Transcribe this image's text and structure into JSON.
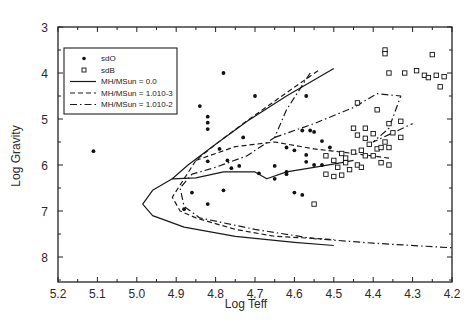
{
  "chart_data": {
    "type": "scatter",
    "title": "",
    "xlabel": "Log Teff",
    "ylabel": "Log Gravity",
    "xlim": [
      5.2,
      4.2
    ],
    "ylim": [
      8.5,
      3
    ],
    "x_ticks": [
      "5.2",
      "5.1",
      "5.0",
      "4.9",
      "4.8",
      "4.7",
      "4.6",
      "4.5",
      "4.4",
      "4.3",
      "4.2"
    ],
    "y_ticks": [
      "3",
      "4",
      "5",
      "6",
      "7",
      "8"
    ],
    "grid": false,
    "legend_position": "upper-left",
    "legend": [
      {
        "label": "sdO",
        "marker": "filled-circle"
      },
      {
        "label": "sdB",
        "marker": "open-square"
      },
      {
        "label": "MH/MSun = 0.0",
        "style": "solid"
      },
      {
        "label": "MH/MSun = 1.010-3",
        "style": "dashed"
      },
      {
        "label": "MH/MSun = 1.010-2",
        "style": "dash-dot"
      }
    ],
    "series": [
      {
        "name": "sdO",
        "type": "scatter",
        "points": [
          [
            5.11,
            5.7
          ],
          [
            4.78,
            4.0
          ],
          [
            4.84,
            4.72
          ],
          [
            4.82,
            4.95
          ],
          [
            4.82,
            5.08
          ],
          [
            4.82,
            5.22
          ],
          [
            4.79,
            5.65
          ],
          [
            4.82,
            5.92
          ],
          [
            4.77,
            5.9
          ],
          [
            4.73,
            5.4
          ],
          [
            4.7,
            4.5
          ],
          [
            4.62,
            5.62
          ],
          [
            4.57,
            4.5
          ],
          [
            4.58,
            5.25
          ],
          [
            4.56,
            5.25
          ],
          [
            4.55,
            5.28
          ],
          [
            4.57,
            5.93
          ],
          [
            4.55,
            6.0
          ],
          [
            4.53,
            6.0
          ],
          [
            4.65,
            6.02
          ],
          [
            4.6,
            5.68
          ],
          [
            4.62,
            6.15
          ],
          [
            4.6,
            6.6
          ],
          [
            4.58,
            6.65
          ],
          [
            4.62,
            6.2
          ],
          [
            4.57,
            5.78
          ],
          [
            4.86,
            6.6
          ],
          [
            4.78,
            6.55
          ],
          [
            4.82,
            6.85
          ],
          [
            4.88,
            6.96
          ],
          [
            4.74,
            6.02
          ],
          [
            4.76,
            6.07
          ],
          [
            4.65,
            6.3
          ],
          [
            4.69,
            6.18
          ],
          [
            4.53,
            5.48
          ],
          [
            4.51,
            5.62
          ]
        ]
      },
      {
        "name": "sdB",
        "type": "scatter",
        "points": [
          [
            4.37,
            3.5
          ],
          [
            4.37,
            3.58
          ],
          [
            4.25,
            3.6
          ],
          [
            4.29,
            3.95
          ],
          [
            4.27,
            4.05
          ],
          [
            4.24,
            4.05
          ],
          [
            4.22,
            4.08
          ],
          [
            4.26,
            4.1
          ],
          [
            4.23,
            4.3
          ],
          [
            4.36,
            4.0
          ],
          [
            4.32,
            4.0
          ],
          [
            4.44,
            4.65
          ],
          [
            4.48,
            5.75
          ],
          [
            4.52,
            5.8
          ],
          [
            4.5,
            5.9
          ],
          [
            4.47,
            5.85
          ],
          [
            4.45,
            5.72
          ],
          [
            4.43,
            5.68
          ],
          [
            4.41,
            5.55
          ],
          [
            4.39,
            5.65
          ],
          [
            4.37,
            5.5
          ],
          [
            4.36,
            5.62
          ],
          [
            4.47,
            5.95
          ],
          [
            4.49,
            6.05
          ],
          [
            4.46,
            6.1
          ],
          [
            4.52,
            6.2
          ],
          [
            4.5,
            6.25
          ],
          [
            4.48,
            6.22
          ],
          [
            4.44,
            6.0
          ],
          [
            4.42,
            5.8
          ],
          [
            4.4,
            5.8
          ],
          [
            4.38,
            5.62
          ],
          [
            4.4,
            5.32
          ],
          [
            4.42,
            5.42
          ],
          [
            4.44,
            5.35
          ],
          [
            4.39,
            4.8
          ],
          [
            4.35,
            5.3
          ],
          [
            4.33,
            5.4
          ],
          [
            4.36,
            5.1
          ],
          [
            4.33,
            5.05
          ],
          [
            4.45,
            5.2
          ],
          [
            4.42,
            5.2
          ],
          [
            4.36,
            6.0
          ],
          [
            4.38,
            5.95
          ],
          [
            4.43,
            6.05
          ],
          [
            4.55,
            6.85
          ]
        ]
      },
      {
        "name": "MH/MSun = 0.0",
        "type": "line",
        "style": "solid",
        "points": [
          [
            4.5,
            3.9
          ],
          [
            4.62,
            4.5
          ],
          [
            4.72,
            5.05
          ],
          [
            4.8,
            5.55
          ],
          [
            4.87,
            6.0
          ],
          [
            4.91,
            6.3
          ],
          [
            4.85,
            6.28
          ],
          [
            4.78,
            6.15
          ],
          [
            4.7,
            6.15
          ],
          [
            4.67,
            6.3
          ],
          [
            4.62,
            6.15
          ],
          [
            4.55,
            6.05
          ],
          [
            4.48,
            5.95
          ],
          [
            4.45,
            5.9
          ]
        ],
        "loop": [
          [
            4.91,
            6.3
          ],
          [
            4.96,
            6.55
          ],
          [
            4.985,
            6.85
          ],
          [
            4.96,
            7.1
          ],
          [
            4.88,
            7.35
          ],
          [
            4.75,
            7.55
          ],
          [
            4.6,
            7.68
          ],
          [
            4.5,
            7.75
          ]
        ]
      },
      {
        "name": "MH/MSun = 1.010-3",
        "type": "line",
        "style": "dashed",
        "points": [
          [
            4.54,
            3.95
          ],
          [
            4.64,
            4.55
          ],
          [
            4.73,
            5.1
          ],
          [
            4.8,
            5.55
          ],
          [
            4.85,
            5.9
          ],
          [
            4.88,
            6.3
          ],
          [
            4.91,
            6.7
          ],
          [
            4.89,
            7.0
          ],
          [
            4.85,
            7.15
          ],
          [
            4.75,
            7.4
          ],
          [
            4.65,
            7.55
          ],
          [
            4.5,
            7.62
          ]
        ],
        "branch": [
          [
            4.85,
            5.9
          ],
          [
            4.75,
            5.6
          ],
          [
            4.65,
            5.5
          ],
          [
            4.55,
            5.65
          ],
          [
            4.45,
            5.75
          ],
          [
            4.36,
            5.85
          ]
        ]
      },
      {
        "name": "MH/MSun = 1.010-2",
        "type": "line",
        "style": "dash-dot",
        "points": [
          [
            4.56,
            4.0
          ],
          [
            4.62,
            4.8
          ],
          [
            4.65,
            5.4
          ],
          [
            4.72,
            5.8
          ],
          [
            4.8,
            6.05
          ],
          [
            4.86,
            6.2
          ],
          [
            4.89,
            6.5
          ],
          [
            4.88,
            6.9
          ],
          [
            4.84,
            7.15
          ],
          [
            4.7,
            7.4
          ],
          [
            4.55,
            7.6
          ],
          [
            4.4,
            7.7
          ],
          [
            4.2,
            7.8
          ]
        ],
        "branch": [
          [
            4.65,
            5.4
          ],
          [
            4.55,
            5.1
          ],
          [
            4.45,
            4.75
          ],
          [
            4.39,
            4.45
          ],
          [
            4.33,
            4.5
          ],
          [
            4.36,
            5.2
          ],
          [
            4.4,
            5.5
          ],
          [
            4.3,
            5.1
          ]
        ]
      }
    ]
  }
}
